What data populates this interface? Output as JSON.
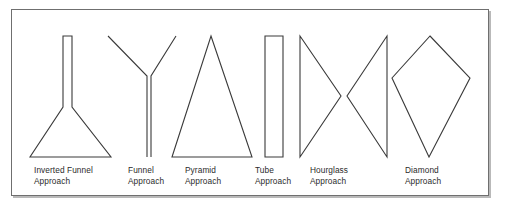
{
  "figure": {
    "name": "presentation-structure-shapes",
    "border_color": "#6f6f6f",
    "shadow_color": "#b9b9b9",
    "background_color": "#ffffff",
    "stroke_color": "#3a3a3a",
    "text_color": "#2b2b2b"
  },
  "shapes": [
    {
      "id": "inverted-funnel",
      "icon_name": "inverted-funnel-shape-icon",
      "label_line1": "Inverted Funnel",
      "label_line2": "Approach",
      "label_x": 34,
      "label_y": 165,
      "geometry": "M 63 36 L 63 107 L 30 157 L 111 157 L 72 107 L 72 36 Z"
    },
    {
      "id": "funnel",
      "icon_name": "funnel-shape-icon",
      "label_line1": "Funnel",
      "label_line2": "Approach",
      "label_x": 128,
      "label_y": 165,
      "geometry": "M 108 36 L 147 76 L 147 157 M 151 157 L 151 76 L 176 36"
    },
    {
      "id": "pyramid",
      "icon_name": "pyramid-shape-icon",
      "label_line1": "Pyramid",
      "label_line2": "Approach",
      "label_x": 185,
      "label_y": 165,
      "geometry": "M 211 36 L 252 157 L 172 157 Z"
    },
    {
      "id": "tube",
      "icon_name": "tube-shape-icon",
      "label_line1": "Tube",
      "label_line2": "Approach",
      "label_x": 255,
      "label_y": 165,
      "geometry": "M 265 36 L 283 36 L 283 157 L 265 157 Z"
    },
    {
      "id": "hourglass",
      "icon_name": "hourglass-shape-icon",
      "label_line1": "Hourglass",
      "label_line2": "Approach",
      "label_x": 310,
      "label_y": 165,
      "geometry": "M 300 36 L 341 96 L 300 157 Z M 387 36 L 347 96 L 387 157 Z"
    },
    {
      "id": "diamond",
      "icon_name": "diamond-shape-icon",
      "label_line1": "Diamond",
      "label_line2": "Approach",
      "label_x": 405,
      "label_y": 165,
      "geometry": "M 430 36 L 470 78 L 429 157 L 392 78 Z"
    }
  ]
}
